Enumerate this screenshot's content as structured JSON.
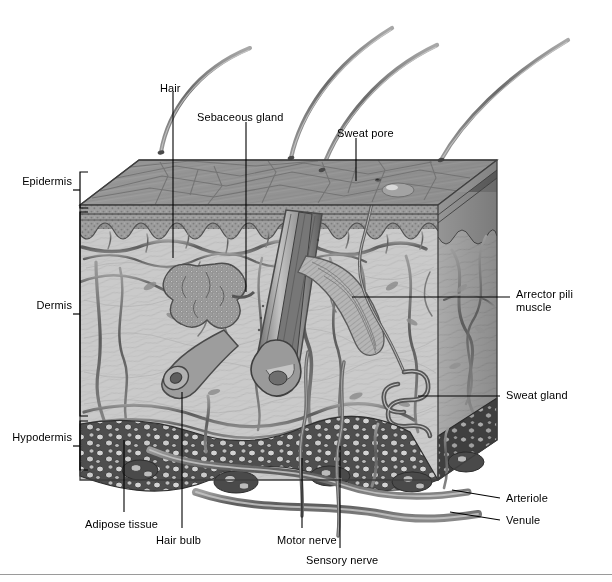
{
  "figure": {
    "type": "anatomical-illustration",
    "style": "grayscale pencil/halftone medical illustration",
    "bottom_rule": true
  },
  "palette": {
    "background": "#ffffff",
    "ink": "#000000",
    "surface_gray": "#989898",
    "epidermis_gray": "#8d8d8d",
    "epidermis_band": "#b3b3b3",
    "dermis_gray": "#c9c9c9",
    "dermis_shadow": "#a8a8a8",
    "hypodermis_gray": "#5a5a5a",
    "vessel_gray": "#6e6e6e",
    "hair_gray": "#808080",
    "leader_line": "#000000"
  },
  "layer_brackets": [
    {
      "id": "epidermis",
      "label": "Epidermis",
      "top": 172,
      "bottom": 208,
      "label_x": 28,
      "label_y": 181
    },
    {
      "id": "dermis",
      "label": "Dermis",
      "top": 212,
      "bottom": 416,
      "label_x": 42,
      "label_y": 305
    },
    {
      "id": "hypodermis",
      "label": "Hypodermis",
      "top": 421,
      "bottom": 470,
      "label_x": 14,
      "label_y": 438
    }
  ],
  "callouts": [
    {
      "id": "hair",
      "label": "Hair",
      "text_x": 160,
      "text_y": 84,
      "align": "left"
    },
    {
      "id": "sebaceous-gland",
      "label": "Sebaceous gland",
      "text_x": 198,
      "text_y": 113,
      "align": "left"
    },
    {
      "id": "sweat-pore",
      "label": "Sweat pore",
      "text_x": 338,
      "text_y": 129,
      "align": "left"
    },
    {
      "id": "arrector-pili-muscle",
      "label": "Arrector pili muscle",
      "text_x": 516,
      "text_y": 293,
      "align": "left",
      "multiline": true
    },
    {
      "id": "sweat-gland",
      "label": "Sweat gland",
      "text_x": 506,
      "text_y": 391,
      "align": "left"
    },
    {
      "id": "arteriole",
      "label": "Arteriole",
      "text_x": 506,
      "text_y": 494,
      "align": "left"
    },
    {
      "id": "venule",
      "label": "Venule",
      "text_x": 506,
      "text_y": 516,
      "align": "left"
    },
    {
      "id": "adipose-tissue",
      "label": "Adipose tissue",
      "text_x": 85,
      "text_y": 520,
      "align": "left"
    },
    {
      "id": "hair-bulb",
      "label": "Hair bulb",
      "text_x": 156,
      "text_y": 536,
      "align": "left"
    },
    {
      "id": "motor-nerve",
      "label": "Motor nerve",
      "text_x": 277,
      "text_y": 536,
      "align": "left"
    },
    {
      "id": "sensory-nerve",
      "label": "Sensory nerve",
      "text_x": 306,
      "text_y": 556,
      "align": "left"
    }
  ],
  "structures": {
    "hairs_above_surface": 4,
    "skin_block": {
      "left": 80,
      "right": 497,
      "surface_top": 140,
      "bottom": 480
    },
    "features": [
      "hair shafts",
      "stratum corneum",
      "dermal papillae",
      "sebaceous gland",
      "hair follicle",
      "hair bulb",
      "arrector pili muscle",
      "sweat gland duct",
      "sweat pore",
      "capillary network",
      "arteriole",
      "venule",
      "motor nerve",
      "sensory nerve",
      "adipose lobules"
    ]
  }
}
